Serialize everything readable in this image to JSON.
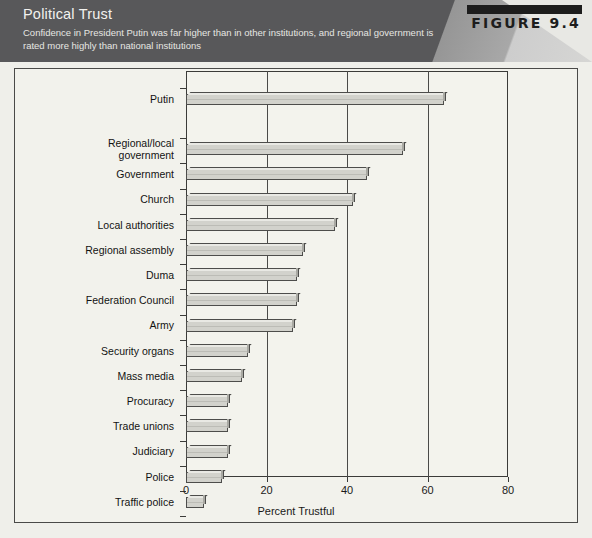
{
  "figure": {
    "number_label": "FIGURE 9.4",
    "title": "Political Trust",
    "subtitle": "Confidence in President Putin was far higher than in other institutions, and regional government is rated more highly than national institutions"
  },
  "colors": {
    "banner_bg": "#58585a",
    "banner_text": "#f2f2ef",
    "figure_block": "#1d1d1d",
    "page_bg": "#efefea",
    "plot_bg": "#f3f3ed",
    "bar_face": "#d2d2cc",
    "bar_outline": "#4d4d4b",
    "axis": "#3b3b39"
  },
  "chart_data": {
    "type": "bar",
    "orientation": "horizontal",
    "title": "Political Trust",
    "subtitle": "Confidence in President Putin was far higher than in other institutions, and regional government is rated more highly than national institutions",
    "xlabel": "Percent Trustful",
    "ylabel": "",
    "xlim": [
      0,
      80
    ],
    "xticks": [
      0,
      20,
      40,
      60,
      80
    ],
    "xtick_labels": [
      "0",
      "20",
      "40",
      "60",
      "80"
    ],
    "grid": true,
    "grid_axis": "x",
    "legend": null,
    "categories": [
      "Putin",
      "Regional/local\ngovernment",
      "Government",
      "Church",
      "Local authorities",
      "Regional assembly",
      "Duma",
      "Federation Council",
      "Army",
      "Security organs",
      "Mass media",
      "Procuracy",
      "Trade unions",
      "Judiciary",
      "Police",
      "Traffic police"
    ],
    "values": [
      64,
      54,
      45,
      41.5,
      37,
      29,
      27.5,
      27.5,
      26.5,
      15.5,
      14,
      10.5,
      10.5,
      10.5,
      9,
      4.5
    ]
  }
}
